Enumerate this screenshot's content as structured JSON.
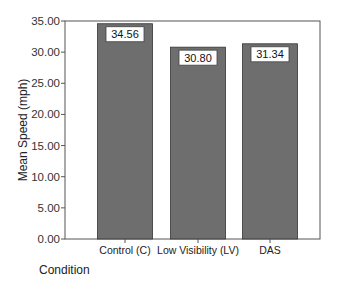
{
  "chart_data": {
    "type": "bar",
    "title": "",
    "xlabel": "Condition",
    "ylabel": "Mean Speed (mph)",
    "categories": [
      "Control (C)",
      "Low Visibility (LV)",
      "DAS"
    ],
    "values": [
      34.56,
      30.8,
      31.34
    ],
    "data_labels": [
      "34.56",
      "30.80",
      "31.34"
    ],
    "ylim": [
      0,
      35
    ],
    "yticks": [
      0,
      5,
      10,
      15,
      20,
      25,
      30,
      35
    ],
    "ytick_labels": [
      "0.00",
      "5.00",
      "10.00",
      "15.00",
      "20.00",
      "25.00",
      "30.00",
      "35.00"
    ],
    "grid": false,
    "bar_color": "#6e6e6e",
    "legend": "none"
  }
}
